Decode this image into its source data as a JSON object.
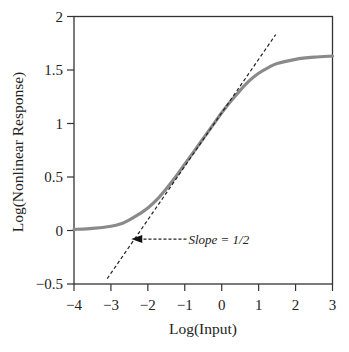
{
  "chart_data": {
    "type": "line",
    "title": "",
    "xlabel": "Log(Input)",
    "ylabel": "Log(Nonlinear Response)",
    "xlim": [
      -4,
      3
    ],
    "ylim": [
      -0.5,
      2
    ],
    "xticks": [
      -4,
      -3,
      -2,
      -1,
      0,
      1,
      2,
      3
    ],
    "xtick_labels": [
      "−4",
      "−3",
      "−2",
      "−1",
      "0",
      "1",
      "2",
      "3"
    ],
    "yticks": [
      -0.5,
      0,
      0.5,
      1,
      1.5,
      2
    ],
    "ytick_labels": [
      "−0.5",
      "0",
      "0.5",
      "1",
      "1.5",
      "2"
    ],
    "grid": false,
    "legend": null,
    "series": [
      {
        "name": "Nonlinear response",
        "style": "solid",
        "color": "#8a8a8a",
        "x": [
          -4,
          -3.5,
          -3,
          -2.75,
          -2.5,
          -2.25,
          -2,
          -1.75,
          -1.5,
          -1.25,
          -1,
          -0.75,
          -0.5,
          -0.25,
          0,
          0.25,
          0.5,
          0.75,
          1,
          1.25,
          1.5,
          2,
          2.5,
          3
        ],
        "y": [
          0.01,
          0.02,
          0.04,
          0.06,
          0.1,
          0.15,
          0.21,
          0.29,
          0.39,
          0.5,
          0.62,
          0.74,
          0.86,
          0.98,
          1.1,
          1.21,
          1.31,
          1.4,
          1.47,
          1.52,
          1.56,
          1.6,
          1.62,
          1.63
        ]
      },
      {
        "name": "Slope = 1/2 asymptote",
        "style": "dashed",
        "color": "#222222",
        "x": [
          -3.1,
          1.46
        ],
        "y": [
          -0.45,
          1.83
        ]
      }
    ],
    "annotations": [
      {
        "text": "Slope = 1/2",
        "x": -0.9,
        "y": -0.08,
        "arrow_to": [
          -2.45,
          -0.08
        ]
      }
    ]
  }
}
